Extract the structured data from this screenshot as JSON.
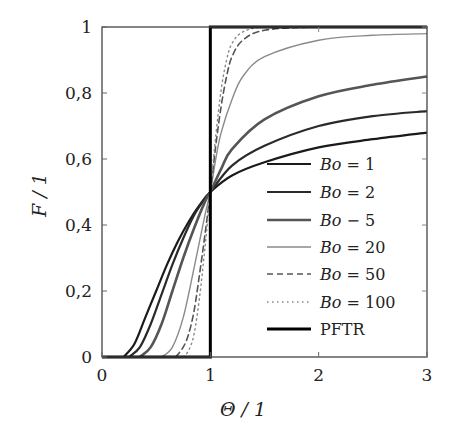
{
  "chart_data": {
    "type": "line",
    "title": "",
    "xlabel": "Θ / 1",
    "ylabel": "F / 1",
    "xlim": [
      0,
      3
    ],
    "ylim": [
      0,
      1
    ],
    "xticks": [
      0,
      1,
      2,
      3
    ],
    "xtick_labels": [
      "0",
      "1",
      "2",
      "3"
    ],
    "yticks": [
      0,
      0.2,
      0.4,
      0.6,
      0.8,
      1
    ],
    "ytick_labels": [
      "0",
      "0,2",
      "0,4",
      "0,6",
      "0,8",
      "1"
    ],
    "grid": false,
    "legend_position": "lower right",
    "series": [
      {
        "name": "Bo = 1",
        "color": "#1a1a1a",
        "width": 2.2,
        "dash": "",
        "x": [
          0.2,
          0.3,
          0.4,
          0.5,
          0.6,
          0.7,
          0.8,
          0.9,
          1.0,
          1.2,
          1.5,
          2.0,
          2.5,
          3.0
        ],
        "y": [
          0.0,
          0.04,
          0.12,
          0.2,
          0.28,
          0.35,
          0.41,
          0.46,
          0.5,
          0.55,
          0.59,
          0.635,
          0.66,
          0.68
        ]
      },
      {
        "name": "Bo = 2",
        "color": "#2a2a2a",
        "width": 2.2,
        "dash": "",
        "x": [
          0.25,
          0.35,
          0.45,
          0.55,
          0.65,
          0.75,
          0.85,
          0.95,
          1.0,
          1.2,
          1.5,
          2.0,
          2.5,
          3.0
        ],
        "y": [
          0.0,
          0.03,
          0.1,
          0.19,
          0.28,
          0.36,
          0.43,
          0.48,
          0.5,
          0.58,
          0.64,
          0.7,
          0.73,
          0.745
        ]
      },
      {
        "name": "Bo = 5",
        "color": "#555555",
        "width": 2.6,
        "dash": "",
        "x": [
          0.35,
          0.45,
          0.55,
          0.65,
          0.75,
          0.85,
          0.95,
          1.0,
          1.1,
          1.2,
          1.5,
          2.0,
          2.5,
          3.0
        ],
        "y": [
          0.0,
          0.03,
          0.1,
          0.2,
          0.3,
          0.39,
          0.47,
          0.5,
          0.57,
          0.63,
          0.72,
          0.79,
          0.825,
          0.85
        ]
      },
      {
        "name": "Bo = 20",
        "color": "#8a8a8a",
        "width": 1.4,
        "dash": "",
        "x": [
          0.55,
          0.65,
          0.75,
          0.85,
          0.95,
          1.0,
          1.05,
          1.1,
          1.2,
          1.3,
          1.5,
          2.0,
          2.5,
          3.0
        ],
        "y": [
          0.0,
          0.03,
          0.12,
          0.27,
          0.43,
          0.5,
          0.6,
          0.68,
          0.78,
          0.85,
          0.91,
          0.96,
          0.975,
          0.98
        ]
      },
      {
        "name": "Bo = 50",
        "color": "#555555",
        "width": 1.6,
        "dash": "6,4",
        "x": [
          0.68,
          0.75,
          0.8,
          0.85,
          0.9,
          0.95,
          1.0,
          1.05,
          1.1,
          1.15,
          1.2,
          1.3,
          1.5,
          2.0,
          3.0
        ],
        "y": [
          0.0,
          0.03,
          0.07,
          0.14,
          0.25,
          0.37,
          0.5,
          0.64,
          0.76,
          0.85,
          0.91,
          0.96,
          0.99,
          1.0,
          1.0
        ]
      },
      {
        "name": "Bo = 100",
        "color": "#888888",
        "width": 1.4,
        "dash": "1.5,3.5",
        "x": [
          0.75,
          0.8,
          0.85,
          0.9,
          0.95,
          1.0,
          1.05,
          1.1,
          1.15,
          1.2,
          1.3,
          1.5,
          2.0,
          3.0
        ],
        "y": [
          0.0,
          0.02,
          0.07,
          0.18,
          0.33,
          0.5,
          0.67,
          0.81,
          0.9,
          0.95,
          0.985,
          1.0,
          1.0,
          1.0
        ]
      },
      {
        "name": "PFTR",
        "color": "#000000",
        "width": 3.0,
        "dash": "",
        "x": [
          0,
          1,
          1,
          3
        ],
        "y": [
          0,
          0,
          1,
          1
        ]
      }
    ]
  },
  "legend": {
    "items": [
      "Bo = 1",
      "Bo = 2",
      "Bo − 5",
      "Bo = 20",
      "Bo = 50",
      "Bo = 100",
      "PFTR"
    ]
  },
  "axes": {
    "xlabel": "Θ / 1",
    "ylabel": "F / 1"
  }
}
